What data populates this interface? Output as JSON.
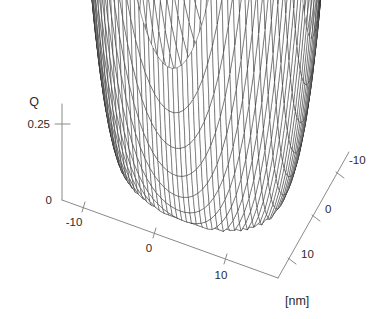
{
  "figure": {
    "kind": "surface-plot-3d",
    "background_color": "#ffffff",
    "mesh_color": "#262626",
    "axis_color": "#8a8a8a",
    "text_color": "#2b2b2b"
  },
  "chart_data": {
    "type": "line",
    "render_as": "3d-wireframe-surface",
    "title": "",
    "subtitle": "",
    "zlabel": "Q",
    "xlabel": "[nm]",
    "ylabel": "",
    "unit_label": "[nm]",
    "grid": false,
    "legend": "none",
    "xlim": [
      -18,
      18
    ],
    "ylim": [
      -18,
      18
    ],
    "zlim": [
      0,
      0.42
    ],
    "x_ticks": [
      -10,
      0,
      10
    ],
    "x_tick_labels": [
      "-10",
      "0",
      "10"
    ],
    "y_ticks": [
      -10,
      0,
      10
    ],
    "y_tick_labels": [
      "-10",
      "0",
      "10"
    ],
    "z_ticks": [
      0,
      0.25
    ],
    "z_tick_labels": [
      "0",
      "0.25"
    ],
    "mesh_nx": 46,
    "mesh_ny": 46,
    "surface_description": "Double-well / saddle potential basin Q(x,y): low valley through the centre, steep walls rising at the back-left and back-right corners, a narrow spike at the left edge and a dark local dip near the front-right.",
    "surface_model": {
      "formula": "Q = a*(r2/s2 - 1)^2 + tilt*x + dip_terms + spike_term",
      "a": 0.255,
      "s": 11.4,
      "tilt": 0.0016,
      "wells": [
        {
          "cx": -8.5,
          "cy": 2.5,
          "depth": 0.052,
          "width": 6.5
        },
        {
          "cx": 7.5,
          "cy": -6.5,
          "depth": 0.075,
          "width": 6.0
        }
      ],
      "spike": {
        "cx": -16.5,
        "cy": 12.5,
        "height": 0.17,
        "width": 2.1
      },
      "saddle_notch": {
        "cx": 0.5,
        "cy": 17.5,
        "depth": 0.055,
        "width": 7.0
      }
    },
    "z_tick_values_described": [
      "0",
      "0.25"
    ],
    "annotations": []
  },
  "labels": {
    "z_axis_title": "Q",
    "z_tick_025": "0.25",
    "z_tick_0": "0",
    "x_tick_m10": "-10",
    "x_tick_0": "0",
    "x_tick_10": "10",
    "y_tick_m10": "-10",
    "y_tick_0": "0",
    "y_tick_10": "10",
    "unit": "[nm]"
  }
}
